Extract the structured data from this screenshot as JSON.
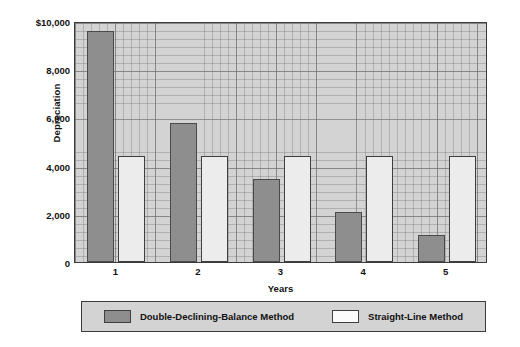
{
  "chart_data": {
    "type": "bar",
    "title": "",
    "xlabel": "Years",
    "ylabel": "Depreciation",
    "categories": [
      "1",
      "2",
      "3",
      "4",
      "5"
    ],
    "ylim": [
      0,
      10000
    ],
    "yticks": [
      0,
      2000,
      4000,
      6000,
      8000,
      10000
    ],
    "ytick_labels": [
      "0",
      "2,000",
      "4,000",
      "6,000",
      "8,000",
      "$10,000"
    ],
    "grid": true,
    "legend_position": "bottom",
    "series": [
      {
        "name": "Double-Declining-Balance Method",
        "color": "#8e8e8e",
        "values": [
          9600,
          5760,
          3456,
          2074,
          1110
        ]
      },
      {
        "name": "Straight-Line Method",
        "color": "#ececec",
        "values": [
          4400,
          4400,
          4400,
          4400,
          4400
        ]
      }
    ]
  },
  "axes": {
    "y_title": "Depreciation",
    "x_title": "Years"
  },
  "legend": {
    "entries": [
      {
        "label": "Double-Declining-Balance Method",
        "swatch": "ddb"
      },
      {
        "label": "Straight-Line Method",
        "swatch": "sl"
      }
    ]
  },
  "colors": {
    "bar_dark": "#8e8e8e",
    "bar_light": "#ececec",
    "plot_background": "#d3d3d3",
    "axis_line": "#3b3b3b",
    "text": "#111111"
  }
}
